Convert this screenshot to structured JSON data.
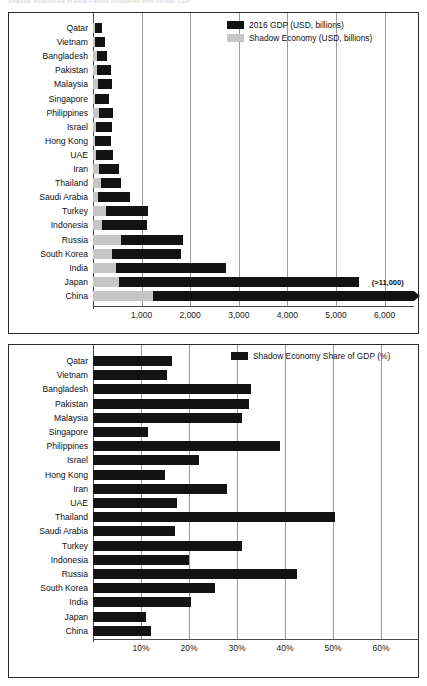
{
  "cut_title": "Shadow economies in Asia-Pacific compared with official GDP",
  "chart_data": [
    {
      "id": "gdp_vs_shadow",
      "type": "bar",
      "orientation": "horizontal",
      "stacked": true,
      "title": "",
      "xlabel": "",
      "ylabel": "",
      "xlim": [
        0,
        6600
      ],
      "xticks": [
        1000,
        2000,
        3000,
        4000,
        5000,
        6000
      ],
      "xticklabels": [
        "1,000",
        "2,000",
        "3,000",
        "4,000",
        "5,000",
        "6,000"
      ],
      "grid": true,
      "legend_position": "top-right",
      "categories": [
        "Qatar",
        "Vietnam",
        "Bangladesh",
        "Pakistan",
        "Malaysia",
        "Singapore",
        "Philippines",
        "Israel",
        "Hong Kong",
        "UAE",
        "Iran",
        "Thailand",
        "Saudi Arabia",
        "Turkey",
        "Indonesia",
        "Russia",
        "South Korea",
        "India",
        "Japan",
        "China"
      ],
      "series": [
        {
          "name": "Shadow Economy (USD, billions)",
          "color": "#c6c6c6",
          "values": [
            28,
            32,
            75,
            90,
            95,
            38,
            115,
            70,
            50,
            65,
            120,
            160,
            110,
            265,
            185,
            570,
            390,
            470,
            530,
            1230
          ]
        },
        {
          "name": "2016 GDP (USD, billions)",
          "color": "#131313",
          "values": [
            152,
            205,
            221,
            284,
            296,
            297,
            305,
            318,
            321,
            349,
            418,
            407,
            646,
            863,
            932,
            1280,
            1411,
            2264,
            4949,
            11200
          ]
        }
      ],
      "annotations": [
        {
          "text": "(>11,000)",
          "category": "China",
          "note": "China bar extends beyond axis"
        }
      ],
      "legend": [
        {
          "label": "2016 GDP (USD, billions)",
          "color": "#131313"
        },
        {
          "label": "Shadow Economy (USD, billions)",
          "color": "#c6c6c6"
        }
      ]
    },
    {
      "id": "shadow_share",
      "type": "bar",
      "orientation": "horizontal",
      "stacked": false,
      "title": "",
      "xlabel": "",
      "ylabel": "",
      "xlim": [
        0,
        68
      ],
      "xticks": [
        10,
        20,
        30,
        40,
        50,
        60
      ],
      "xticklabels": [
        "10%",
        "20%",
        "30%",
        "40%",
        "50%",
        "60%"
      ],
      "grid": true,
      "legend_position": "top-right",
      "categories": [
        "Qatar",
        "Vietnam",
        "Bangladesh",
        "Pakistan",
        "Malaysia",
        "Singapore",
        "Philippines",
        "Israel",
        "Hong Kong",
        "Iran",
        "UAE",
        "Thailand",
        "Saudi Arabia",
        "Turkey",
        "Indonesia",
        "Russia",
        "South Korea",
        "India",
        "Japan",
        "China"
      ],
      "series": [
        {
          "name": "Shadow Economy Share of GDP (%)",
          "color": "#131313",
          "values": [
            16.5,
            15.5,
            33.0,
            32.5,
            31.0,
            11.5,
            39.0,
            22.0,
            15.0,
            28.0,
            17.5,
            50.5,
            17.0,
            31.0,
            20.0,
            42.5,
            25.5,
            20.5,
            11.0,
            12.0
          ]
        }
      ],
      "legend": [
        {
          "label": "Shadow Economy Share of GDP (%)",
          "color": "#131313"
        }
      ]
    }
  ]
}
